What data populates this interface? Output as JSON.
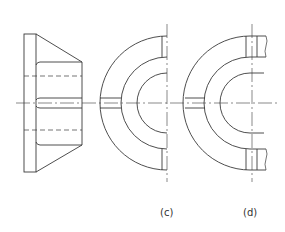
{
  "figure": {
    "type": "engineering-drawing",
    "line_color": "#3a3a3a",
    "views": [
      {
        "id": "side-view",
        "label": ""
      },
      {
        "id": "view-c",
        "label": "(c)"
      },
      {
        "id": "view-d",
        "label": "(d)"
      }
    ]
  }
}
